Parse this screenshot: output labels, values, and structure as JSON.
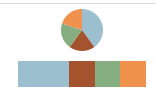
{
  "chart_data": [
    {
      "type": "pie",
      "title": "",
      "categories": [
        "blue",
        "brown",
        "green",
        "orange"
      ],
      "values": [
        40,
        20,
        20,
        20
      ],
      "colors": [
        "#9cbfd0",
        "#a4532f",
        "#86ae80",
        "#f0914e"
      ],
      "start_angle": "12 o'clock, clockwise",
      "legend": false
    },
    {
      "type": "bar",
      "orientation": "horizontal-stacked",
      "title": "",
      "categories": [
        "blue",
        "brown",
        "green",
        "orange"
      ],
      "values": [
        40,
        20,
        20,
        20
      ],
      "colors": [
        "#9cbfd0",
        "#a4532f",
        "#86ae80",
        "#f0914e"
      ],
      "axes": false,
      "legend": false
    }
  ]
}
